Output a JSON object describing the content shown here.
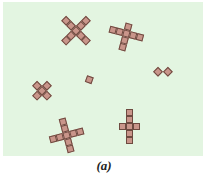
{
  "figure": {
    "caption": "(a)",
    "background_color": "#e3f5e1",
    "cell_color": "#c9958a",
    "cell_border_color": "#6e4a40"
  },
  "shapes": [
    {
      "name": "x-cross-diagonal",
      "cx": 76,
      "cy": 30,
      "rotate": 45,
      "cells": [
        [
          0,
          0
        ],
        [
          0,
          -1
        ],
        [
          0,
          -2
        ],
        [
          0,
          1
        ],
        [
          0,
          2
        ],
        [
          -1,
          0
        ],
        [
          -2,
          0
        ],
        [
          1,
          0
        ],
        [
          2,
          0
        ]
      ]
    },
    {
      "name": "plus-tilted",
      "cx": 126,
      "cy": 33,
      "rotate": 15,
      "cells": [
        [
          0,
          0
        ],
        [
          -1,
          0
        ],
        [
          -2,
          0
        ],
        [
          1,
          0
        ],
        [
          2,
          0
        ],
        [
          0,
          -1
        ],
        [
          0,
          1
        ],
        [
          0,
          2
        ]
      ]
    },
    {
      "name": "staircase-diagonal",
      "cx": 42,
      "cy": 90,
      "rotate": 45,
      "cells": [
        [
          0,
          0
        ],
        [
          0,
          -1
        ],
        [
          -1,
          0
        ],
        [
          1,
          0
        ],
        [
          0,
          1
        ]
      ]
    },
    {
      "name": "single-square",
      "cx": 89,
      "cy": 79,
      "rotate": 20,
      "cells": [
        [
          0,
          0
        ]
      ]
    },
    {
      "name": "two-diamonds",
      "cx": 158,
      "cy": 71,
      "rotate": 45,
      "cells": [
        [
          0,
          0
        ],
        [
          1,
          -1
        ]
      ]
    },
    {
      "name": "plus-long-tilted",
      "cx": 66,
      "cy": 135,
      "rotate": -15,
      "cells": [
        [
          0,
          0
        ],
        [
          -1,
          0
        ],
        [
          -2,
          0
        ],
        [
          1,
          0
        ],
        [
          2,
          0
        ],
        [
          0,
          -1
        ],
        [
          0,
          -2
        ],
        [
          0,
          1
        ],
        [
          0,
          2
        ]
      ]
    },
    {
      "name": "cross-upright",
      "cx": 129,
      "cy": 126,
      "rotate": 0,
      "cells": [
        [
          0,
          0
        ],
        [
          -1,
          0
        ],
        [
          1,
          0
        ],
        [
          0,
          -1
        ],
        [
          0,
          -2
        ],
        [
          0,
          1
        ],
        [
          0,
          2
        ]
      ]
    }
  ]
}
